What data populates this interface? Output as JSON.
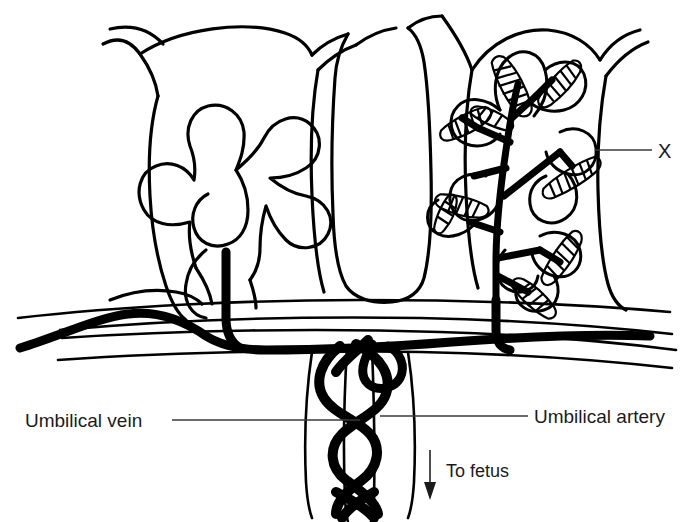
{
  "figure": {
    "type": "anatomical-diagram",
    "background_color": "#ffffff",
    "ink_color": "#000000",
    "leader_line_color": "#3a3a3a"
  },
  "labels": {
    "umbilical_vein": "Umbilical vein",
    "umbilical_artery": "Umbilical artery",
    "to_fetus": "To fetus",
    "callout_x": "X"
  },
  "structures": {
    "left_villus": "outline-only branching villus (no vessels drawn)",
    "right_villus": "villus with black fetal vessel tree and hatched capillary tips",
    "central_septum": "placental septum between villi",
    "chorionic_plate": "horizontal band carrying chorionic vessels",
    "cord": "umbilical cord with helically coiled vessels"
  },
  "annotations": {
    "arrow_direction": "down",
    "arrow_meaning": "blood flow to fetus"
  }
}
